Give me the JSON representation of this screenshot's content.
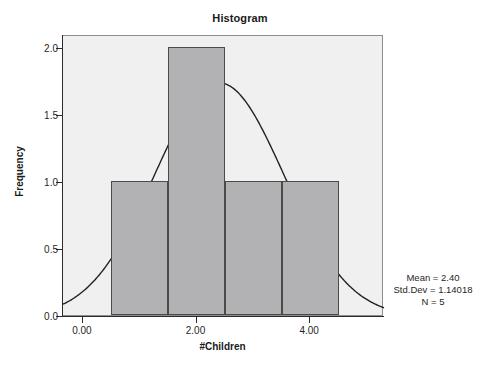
{
  "chart_data": {
    "type": "bar",
    "title": "Histogram",
    "xlabel": "#Children",
    "ylabel": "Frequency",
    "xlim": [
      -0.35,
      5.3
    ],
    "ylim": [
      0,
      2.1
    ],
    "grid": false,
    "legend": null,
    "bin_width": 1,
    "bins": [
      {
        "left": 0.5,
        "right": 1.5,
        "center": 1.0,
        "value": 1
      },
      {
        "left": 1.5,
        "right": 2.5,
        "center": 2.0,
        "value": 2
      },
      {
        "left": 2.5,
        "right": 3.5,
        "center": 3.0,
        "value": 1
      },
      {
        "left": 3.5,
        "right": 4.5,
        "center": 4.0,
        "value": 1
      }
    ],
    "categories": [
      "0.5-1.5",
      "1.5-2.5",
      "2.5-3.5",
      "3.5-4.5"
    ],
    "values": [
      1,
      2,
      1,
      1
    ],
    "xticks": [
      0,
      2,
      4
    ],
    "xticklabels": [
      "0.00",
      "2.00",
      "4.00"
    ],
    "yticks": [
      0.0,
      0.5,
      1.0,
      1.5,
      2.0
    ],
    "yticklabels": [
      "0.0",
      "0.5",
      "1.0",
      "1.5",
      "2.0"
    ],
    "overlay_curve": {
      "name": "normal-distribution-curve",
      "distribution": "normal",
      "mean": 2.4,
      "std_dev": 1.14018,
      "n": 5,
      "peak_value": 1.749
    },
    "annotations": {
      "mean_label": "Mean = 2.40",
      "stddev_label": "Std.Dev = 1.14018",
      "n_label": "N = 5"
    },
    "colors": {
      "bar_fill": "#b2b1b3",
      "bar_edge": "#4a4a4a",
      "plot_background": "#f1f0f1",
      "figure_background": "#ffffff",
      "curve": "#222222",
      "axis": "#2b2b2b",
      "text": "#1a1a1a"
    }
  }
}
